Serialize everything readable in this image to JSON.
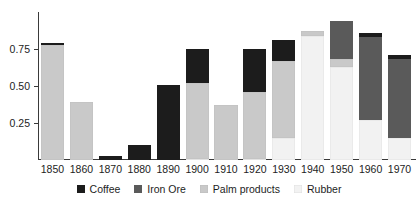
{
  "chart_data": {
    "type": "bar",
    "stacked": true,
    "title": "",
    "subtitle": "",
    "xlabel": "",
    "ylabel": "",
    "categories": [
      "1850",
      "1860",
      "1870",
      "1880",
      "1890",
      "1900",
      "1910",
      "1920",
      "1930",
      "1940",
      "1950",
      "1960",
      "1970"
    ],
    "series": [
      {
        "name": "Coffee",
        "color": "#1c1c1c",
        "values": [
          0.01,
          0.0,
          0.03,
          0.1,
          0.51,
          0.23,
          0.0,
          0.29,
          0.14,
          0.0,
          0.0,
          0.03,
          0.03
        ]
      },
      {
        "name": "Iron Ore",
        "color": "#5a5a5a",
        "values": [
          0.0,
          0.0,
          0.0,
          0.0,
          0.0,
          0.0,
          0.0,
          0.0,
          0.0,
          0.0,
          0.26,
          0.56,
          0.53
        ]
      },
      {
        "name": "Palm products",
        "color": "#c9c9c9",
        "values": [
          0.78,
          0.39,
          0.0,
          0.0,
          0.0,
          0.51,
          0.37,
          0.45,
          0.52,
          0.03,
          0.05,
          0.0,
          0.0
        ]
      },
      {
        "name": "Rubber",
        "color": "#f2f2f2",
        "values": [
          0.0,
          0.0,
          0.0,
          0.0,
          0.0,
          0.01,
          0.0,
          0.01,
          0.15,
          0.84,
          0.63,
          0.27,
          0.15
        ]
      }
    ],
    "totals": [
      0.79,
      0.39,
      0.03,
      0.1,
      0.51,
      0.75,
      0.37,
      0.75,
      0.81,
      0.87,
      0.94,
      0.86,
      0.71
    ],
    "yticks": [
      0.25,
      0.5,
      0.75
    ],
    "ytick_labels": [
      "0.25",
      "0.50",
      "0.75"
    ],
    "ylim": [
      0,
      1.0
    ],
    "grid": false,
    "legend_position": "bottom"
  },
  "axis": {
    "y_labels": [
      "0.75",
      "0.50",
      "0.25"
    ],
    "x_labels": [
      "1850",
      "1860",
      "1870",
      "1880",
      "1890",
      "1900",
      "1910",
      "1920",
      "1930",
      "1940",
      "1950",
      "1960",
      "1970"
    ]
  },
  "legend": {
    "items": [
      {
        "label": "Coffee",
        "color": "#1c1c1c"
      },
      {
        "label": "Iron Ore",
        "color": "#5a5a5a"
      },
      {
        "label": "Palm products",
        "color": "#c9c9c9"
      },
      {
        "label": "Rubber",
        "color": "#f2f2f2"
      }
    ]
  },
  "colors": {
    "axis": "#3a3a3a",
    "text": "#1d1d1d",
    "background": "#ffffff"
  }
}
